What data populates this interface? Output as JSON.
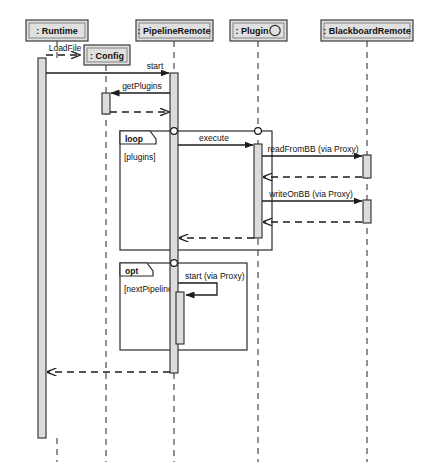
{
  "diagram": {
    "type": "uml-sequence-diagram",
    "width": 427,
    "height": 467,
    "background": "#ffffff",
    "line_color": "#1d1d1d",
    "header_fill": "#e0e0e0",
    "activation_fill": "#dcdcdc"
  },
  "lifelines": [
    {
      "id": "runtime",
      "label": ": Runtime",
      "x": 57,
      "box": {
        "x": 26,
        "y": 20,
        "w": 62,
        "h": 21
      },
      "interface_marker": false
    },
    {
      "id": "config",
      "label": ": Config",
      "x": 106,
      "box": {
        "x": 84,
        "y": 45,
        "w": 46,
        "h": 20
      },
      "interface_marker": false
    },
    {
      "id": "pipeline",
      "label": ": PipelineRemote",
      "x": 174,
      "box": {
        "x": 136,
        "y": 20,
        "w": 77,
        "h": 21
      },
      "interface_marker": false
    },
    {
      "id": "plugin",
      "label": ": Plugin",
      "x": 258,
      "box": {
        "x": 230,
        "y": 20,
        "w": 57,
        "h": 21
      },
      "interface_marker": true
    },
    {
      "id": "blackboard",
      "label": ": BlackboardRemote",
      "x": 367,
      "box": {
        "x": 321,
        "y": 20,
        "w": 92,
        "h": 21
      },
      "interface_marker": false
    }
  ],
  "activations": [
    {
      "id": "runtime-act",
      "lifeline": "runtime",
      "x": 38,
      "y": 58,
      "w": 8,
      "h": 380
    },
    {
      "id": "config-act",
      "lifeline": "config",
      "x": 102,
      "y": 93,
      "w": 8,
      "h": 20
    },
    {
      "id": "pipeline-act",
      "lifeline": "pipeline",
      "x": 170,
      "y": 73,
      "w": 8,
      "h": 300
    },
    {
      "id": "pipeline-act-nested",
      "lifeline": "pipeline",
      "x": 176,
      "y": 292,
      "w": 8,
      "h": 52
    },
    {
      "id": "plugin-act",
      "lifeline": "plugin",
      "x": 254,
      "y": 144,
      "w": 8,
      "h": 94
    },
    {
      "id": "blackboard-act-1",
      "lifeline": "blackboard",
      "x": 363,
      "y": 155,
      "w": 8,
      "h": 22
    },
    {
      "id": "blackboard-act-2",
      "lifeline": "blackboard",
      "x": 363,
      "y": 200,
      "w": 8,
      "h": 22
    }
  ],
  "messages": [
    {
      "id": "msg-loadfile",
      "label": "LoadFile",
      "kind": "create",
      "style": "dashed",
      "from": "runtime",
      "to": "config",
      "y": 55,
      "label_x": 64,
      "label_y": 49
    },
    {
      "id": "msg-start",
      "label": "start",
      "kind": "call",
      "style": "solid",
      "from": "runtime",
      "to": "pipeline",
      "y": 73,
      "label_x": 157,
      "label_y": 69
    },
    {
      "id": "msg-getplugins",
      "label": "getPlugins",
      "kind": "call",
      "style": "solid",
      "from": "pipeline",
      "to": "config",
      "y": 93,
      "label_x": 140,
      "label_y": 89
    },
    {
      "id": "msg-getplugins-return",
      "label": "",
      "kind": "return",
      "style": "dashed",
      "from": "config",
      "to": "pipeline",
      "y": 112,
      "label_x": 0,
      "label_y": 0
    },
    {
      "id": "msg-execute",
      "label": "execute",
      "kind": "call",
      "style": "solid",
      "from": "pipeline",
      "to": "plugin",
      "y": 145,
      "label_x": 215,
      "label_y": 141
    },
    {
      "id": "msg-readfrombb",
      "label": "readFromBB (via Proxy)",
      "kind": "call",
      "style": "solid",
      "from": "plugin",
      "to": "blackboard",
      "y": 156,
      "label_x": 310,
      "label_y": 152
    },
    {
      "id": "msg-readfrombb-return",
      "label": "",
      "kind": "return",
      "style": "dashed",
      "from": "blackboard",
      "to": "plugin",
      "y": 177,
      "label_x": 0,
      "label_y": 0
    },
    {
      "id": "msg-writeonbb",
      "label": "writeOnBB (via Proxy)",
      "kind": "call",
      "style": "solid",
      "from": "plugin",
      "to": "blackboard",
      "y": 201,
      "label_x": 308,
      "label_y": 197
    },
    {
      "id": "msg-writeonbb-return",
      "label": "",
      "kind": "return",
      "style": "dashed",
      "from": "blackboard",
      "to": "plugin",
      "y": 222,
      "label_x": 0,
      "label_y": 0
    },
    {
      "id": "msg-execute-return",
      "label": "",
      "kind": "return",
      "style": "dashed",
      "from": "plugin",
      "to": "pipeline",
      "y": 238,
      "label_x": 0,
      "label_y": 0
    },
    {
      "id": "msg-start-via-proxy",
      "label": "start (via Proxy)",
      "kind": "self-call",
      "style": "solid",
      "from": "pipeline",
      "to": "pipeline",
      "y": 283,
      "label_x": 186,
      "label_y": 279
    },
    {
      "id": "msg-start-return",
      "label": "",
      "kind": "return",
      "style": "dashed",
      "from": "pipeline",
      "to": "runtime",
      "y": 372,
      "label_x": 0,
      "label_y": 0
    }
  ],
  "fragments": [
    {
      "id": "frag-loop",
      "operator": "loop",
      "guard": "[plugins]",
      "x": 120,
      "y": 131,
      "w": 152,
      "h": 119,
      "tab_w": 30,
      "tab_h": 13,
      "operator_x": 125,
      "operator_y": 141,
      "guard_x": 124,
      "guard_y": 157
    },
    {
      "id": "frag-opt",
      "operator": "opt",
      "guard": "[nextPipeline]",
      "x": 120,
      "y": 263,
      "w": 127,
      "h": 87,
      "tab_w": 27,
      "tab_h": 13,
      "operator_x": 125,
      "operator_y": 273,
      "guard_x": 124,
      "guard_y": 289
    }
  ],
  "gates": [
    {
      "id": "gate-loop-pipeline",
      "x": 174,
      "y": 131,
      "r": 3.4
    },
    {
      "id": "gate-loop-plugin",
      "x": 258,
      "y": 131,
      "r": 3.4
    },
    {
      "id": "gate-opt-pipeline",
      "x": 174,
      "y": 263,
      "r": 3.4
    }
  ]
}
